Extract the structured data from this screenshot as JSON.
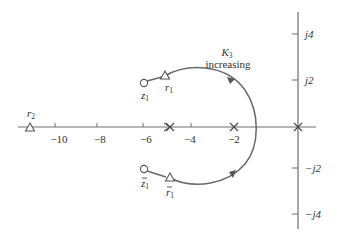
{
  "diagram": {
    "type": "root-locus",
    "title": "",
    "annotation": {
      "gain_symbol": "K",
      "gain_subscript": "3",
      "gain_text": "increasing"
    },
    "real_axis": {
      "ticks": [
        {
          "value": -10,
          "label": "−10"
        },
        {
          "value": -8,
          "label": "−8"
        },
        {
          "value": -6,
          "label": "−6"
        },
        {
          "value": -4,
          "label": "−4"
        },
        {
          "value": -2,
          "label": "−2"
        }
      ]
    },
    "imag_axis": {
      "ticks": [
        {
          "value": 4,
          "label": "j4"
        },
        {
          "value": 2,
          "label": "j2"
        },
        {
          "value": -2,
          "label": "−j2"
        },
        {
          "value": -4,
          "label": "−j4"
        }
      ]
    },
    "poles": [
      {
        "re": -5,
        "im": 0
      },
      {
        "re": -2,
        "im": 0
      },
      {
        "re": 0,
        "im": 0
      }
    ],
    "zeros": [
      {
        "label": "z",
        "sub": "1",
        "conj": false,
        "re": -6,
        "im": 2
      },
      {
        "label": "z",
        "sub": "1",
        "conj": true,
        "re": -6,
        "im": -2
      }
    ],
    "roots": [
      {
        "label": "r",
        "sub": "1",
        "conj": false
      },
      {
        "label": "r",
        "sub": "1",
        "conj": true
      },
      {
        "label": "r",
        "sub": "2",
        "conj": false
      }
    ]
  }
}
